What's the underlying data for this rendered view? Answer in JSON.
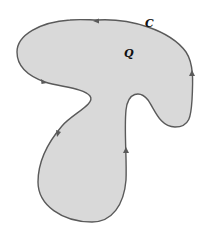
{
  "diagram": {
    "type": "planar-region-with-boundary-curve",
    "region_label": "Q",
    "curve_label": "C",
    "colors": {
      "fill": "#d9d9d9",
      "stroke": "#5a5a5a",
      "text": "#111111"
    },
    "orientation": "counterclockwise",
    "arrow_count": 5
  }
}
